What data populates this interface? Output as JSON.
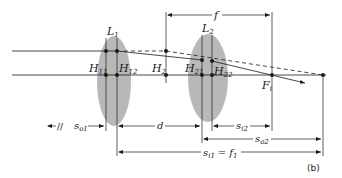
{
  "figure": {
    "panel_label": "(b)",
    "lenses": [
      {
        "name": "L",
        "sub": "1"
      },
      {
        "name": "L",
        "sub": "2"
      }
    ],
    "principal_points": [
      {
        "name": "H",
        "sub": "11"
      },
      {
        "name": "H",
        "sub": "12"
      },
      {
        "name": "H",
        "sub": "2"
      },
      {
        "name": "H",
        "sub": "21"
      },
      {
        "name": "H",
        "sub": "22"
      }
    ],
    "focal_point": {
      "name": "F",
      "sub": "i"
    },
    "focal_length_label": "f",
    "dimensions": {
      "so1": {
        "name": "s",
        "sub": "o1",
        "break_mark": "//"
      },
      "d": {
        "name": "d"
      },
      "si2": {
        "name": "s",
        "sub": "i2"
      },
      "so2": {
        "name": "s",
        "sub": "o2"
      },
      "si1": {
        "name": "s",
        "sub": "i1",
        "equals": "=",
        "rhs": "f",
        "rhs_sub": "1"
      }
    },
    "colors": {
      "lens_fill": "#b8b8b8",
      "line": "#1a1a1a",
      "background": "#ffffff"
    }
  }
}
